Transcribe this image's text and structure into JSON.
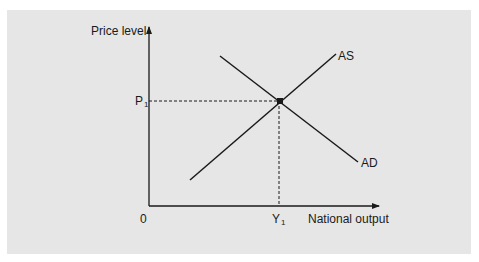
{
  "diagram": {
    "type": "AD-AS equilibrium",
    "y_axis_label": "Price level",
    "x_axis_label": "National output",
    "origin_label": "0",
    "price_label": {
      "main": "P",
      "sub": "1"
    },
    "output_label": {
      "main": "Y",
      "sub": "1"
    },
    "curves": [
      {
        "name": "AS",
        "label": "AS",
        "slope": "upward"
      },
      {
        "name": "AD",
        "label": "AD",
        "slope": "downward"
      }
    ],
    "equilibrium": {
      "price": "P1",
      "output": "Y1"
    },
    "colors": {
      "background": "#e6e6e6",
      "lines": "#1a1a1a"
    }
  }
}
